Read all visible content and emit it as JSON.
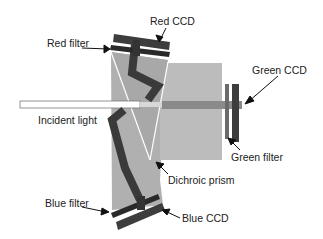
{
  "diagram": {
    "labels": {
      "red_filter": "Red filter",
      "red_ccd": "Red CCD",
      "green_ccd": "Green CCD",
      "green_filter": "Green filter",
      "incident_light": "Incident light",
      "dichroic_prism": "Dichroic prism",
      "blue_filter": "Blue filter",
      "blue_ccd": "Blue CCD"
    },
    "colors": {
      "prism": "#b3b3b3",
      "prism_right": "#bdbdbd",
      "beam_dark": "#3a3a3a",
      "ccd": "#3d3d3d",
      "filter": "#2a2a2a",
      "green_beam": "#8a8a8a",
      "edge": "#ffffff",
      "text": "#222222"
    }
  }
}
